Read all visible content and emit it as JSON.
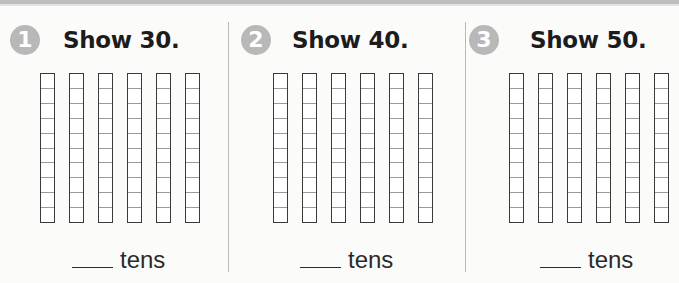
{
  "problems": [
    {
      "number": "1",
      "title": "Show 30.",
      "rod_count": 6,
      "cells_per_rod": 10,
      "answer_blank": "",
      "unit": "tens"
    },
    {
      "number": "2",
      "title": "Show 40.",
      "rod_count": 6,
      "cells_per_rod": 10,
      "answer_blank": "",
      "unit": "tens"
    },
    {
      "number": "3",
      "title": "Show 50.",
      "rod_count": 6,
      "cells_per_rod": 10,
      "answer_blank": "",
      "unit": "tens"
    }
  ],
  "colors": {
    "number_badge": "#b8b8b8",
    "title_text": "#1c1c1c",
    "rod_border": "#3a3a3a",
    "cell_divider": "#9a9a9a",
    "separator": "#b9b9b9"
  }
}
